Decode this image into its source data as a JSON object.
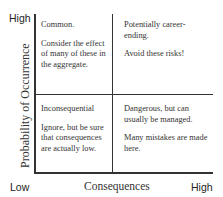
{
  "axes": {
    "y_label": "Probability of Occurrence",
    "y_high": "High",
    "x_label": "Consequences",
    "x_low": "Low",
    "x_high": "High"
  },
  "quadrants": {
    "top_left": {
      "title": "Common.",
      "body": "Consider the effect of many of these in the aggregate."
    },
    "top_right": {
      "title": "Potentially career-ending.",
      "body": "Avoid these risks!"
    },
    "bottom_left": {
      "title": "Inconsequential",
      "body": "Ignore, but be sure that consequences are actually low."
    },
    "bottom_right": {
      "title": "Dangerous, but can usually be managed.",
      "body": "Many mistakes are made here."
    }
  }
}
